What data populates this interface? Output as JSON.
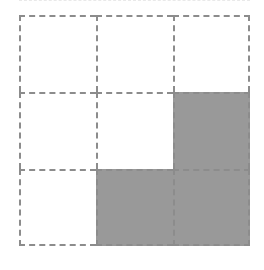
{
  "figure": {
    "rows": 3,
    "columns": 3,
    "background_color": "#ffffff",
    "border_color": "#8c8c8c",
    "border_style": "dashed",
    "shaded_color": "#999999",
    "unshaded_color": "#ffffff",
    "shaded_count": 3,
    "total_count": 9,
    "fraction_shaded": "3/9",
    "cells": [
      {
        "row": 1,
        "column": 1,
        "shaded": false,
        "label": ""
      },
      {
        "row": 1,
        "column": 2,
        "shaded": false,
        "label": ""
      },
      {
        "row": 1,
        "column": 3,
        "shaded": false,
        "label": ""
      },
      {
        "row": 2,
        "column": 1,
        "shaded": false,
        "label": ""
      },
      {
        "row": 2,
        "column": 2,
        "shaded": false,
        "label": ""
      },
      {
        "row": 2,
        "column": 3,
        "shaded": true,
        "label": ""
      },
      {
        "row": 3,
        "column": 1,
        "shaded": false,
        "label": ""
      },
      {
        "row": 3,
        "column": 2,
        "shaded": true,
        "label": ""
      },
      {
        "row": 3,
        "column": 3,
        "shaded": true,
        "label": ""
      }
    ]
  },
  "clipped_row_remnant": {
    "visible": true,
    "color": "#e9e9e9"
  }
}
